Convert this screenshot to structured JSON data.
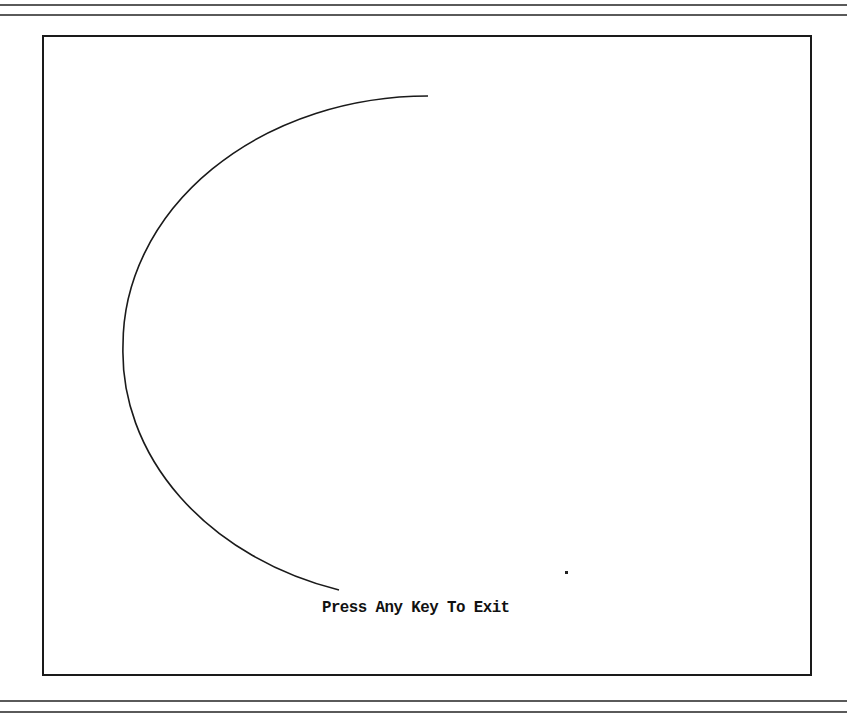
{
  "screen": {
    "type": "dos-graphics-demo",
    "background": "#ffffff",
    "foreground": "#111111"
  },
  "prompt": {
    "text": "Press Any Key To Exit"
  },
  "drawing": {
    "shape": "elliptical-arc",
    "center": [
      428,
      345
    ],
    "radius_x": 305,
    "radius_y": 249,
    "start_point": [
      428,
      96
    ],
    "end_point": [
      339,
      594
    ],
    "direction": "counter-clockwise via left side"
  },
  "stray_pixel": {
    "position": [
      566,
      572
    ]
  }
}
